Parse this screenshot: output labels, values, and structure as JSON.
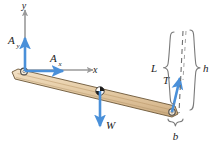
{
  "figure": {
    "type": "free-body-diagram",
    "background_color": "#ffffff"
  },
  "colors": {
    "force_arrow": "#4a90d9",
    "force_arrow_dark": "#2f74b5",
    "axis_line": "#9a9a9a",
    "beam_fill": "#e3c9a3",
    "beam_fill_light": "#f0ddc2",
    "beam_edge": "#6b5637",
    "bracket": "#7a7a7a",
    "dashed_line": "#6f6f6f",
    "label_text": "#1c1c1c"
  },
  "axes": {
    "y_label": "y",
    "x_label": "x",
    "origin_note": "pivot at left end of beam"
  },
  "forces": [
    {
      "name": "A_y",
      "symbol": "A",
      "subscript": "y",
      "direction": "up",
      "color": "#4a90d9",
      "applied_at": "left pivot"
    },
    {
      "name": "A_x",
      "symbol": "A",
      "subscript": "x",
      "direction": "right",
      "color": "#4a90d9",
      "applied_at": "left pivot"
    },
    {
      "name": "W",
      "symbol": "W",
      "subscript": "",
      "direction": "down",
      "color": "#4a90d9",
      "applied_at": "center of mass"
    },
    {
      "name": "T",
      "symbol": "T",
      "subscript": "",
      "direction": "up-right",
      "color": "#4a90d9",
      "applied_at": "right end of beam"
    }
  ],
  "dimensions": [
    {
      "name": "L",
      "label": "L",
      "bracket": "left-curly",
      "note": "cable length along beam side"
    },
    {
      "name": "h",
      "label": "h",
      "bracket": "right-curly",
      "note": "total vertical height"
    },
    {
      "name": "b",
      "label": "b",
      "bracket": "bottom-curly",
      "note": "horizontal offset at base"
    }
  ],
  "markers": {
    "center_of_mass": "center-of-mass-symbol",
    "left_pivot": "pin-support",
    "right_pin": "pin-joint"
  }
}
